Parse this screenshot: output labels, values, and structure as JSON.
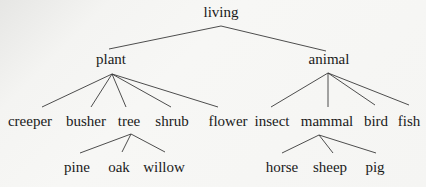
{
  "diagram": {
    "type": "tree",
    "line_color": "#3a3a3a",
    "text_color": "#1a1a1a",
    "nodes": {
      "living": {
        "label": "living",
        "x": 221,
        "y": 5
      },
      "plant": {
        "label": "plant",
        "x": 111,
        "y": 52
      },
      "animal": {
        "label": "animal",
        "x": 329,
        "y": 52
      },
      "creeper": {
        "label": "creeper",
        "x": 30,
        "y": 114
      },
      "busher": {
        "label": "busher",
        "x": 86,
        "y": 114
      },
      "tree": {
        "label": "tree",
        "x": 129,
        "y": 114
      },
      "shrub": {
        "label": "shrub",
        "x": 172,
        "y": 114
      },
      "flower": {
        "label": "flower",
        "x": 228,
        "y": 114
      },
      "insect": {
        "label": "insect",
        "x": 272,
        "y": 114
      },
      "mammal": {
        "label": "mammal",
        "x": 327,
        "y": 114
      },
      "bird": {
        "label": "bird",
        "x": 376,
        "y": 114
      },
      "fish": {
        "label": "fish",
        "x": 409,
        "y": 114
      },
      "pine": {
        "label": "pine",
        "x": 77,
        "y": 160
      },
      "oak": {
        "label": "oak",
        "x": 119,
        "y": 160
      },
      "willow": {
        "label": "willow",
        "x": 164,
        "y": 160
      },
      "horse": {
        "label": "horse",
        "x": 282,
        "y": 160
      },
      "sheep": {
        "label": "sheep",
        "x": 330,
        "y": 160
      },
      "pig": {
        "label": "pig",
        "x": 375,
        "y": 160
      }
    },
    "edges": [
      [
        "living",
        "plant"
      ],
      [
        "living",
        "animal"
      ],
      [
        "plant",
        "creeper"
      ],
      [
        "plant",
        "busher"
      ],
      [
        "plant",
        "tree"
      ],
      [
        "plant",
        "shrub"
      ],
      [
        "plant",
        "flower"
      ],
      [
        "animal",
        "insect"
      ],
      [
        "animal",
        "mammal"
      ],
      [
        "animal",
        "bird"
      ],
      [
        "animal",
        "fish"
      ],
      [
        "tree",
        "pine"
      ],
      [
        "tree",
        "oak"
      ],
      [
        "tree",
        "willow"
      ],
      [
        "mammal",
        "horse"
      ],
      [
        "mammal",
        "sheep"
      ],
      [
        "mammal",
        "pig"
      ]
    ]
  }
}
